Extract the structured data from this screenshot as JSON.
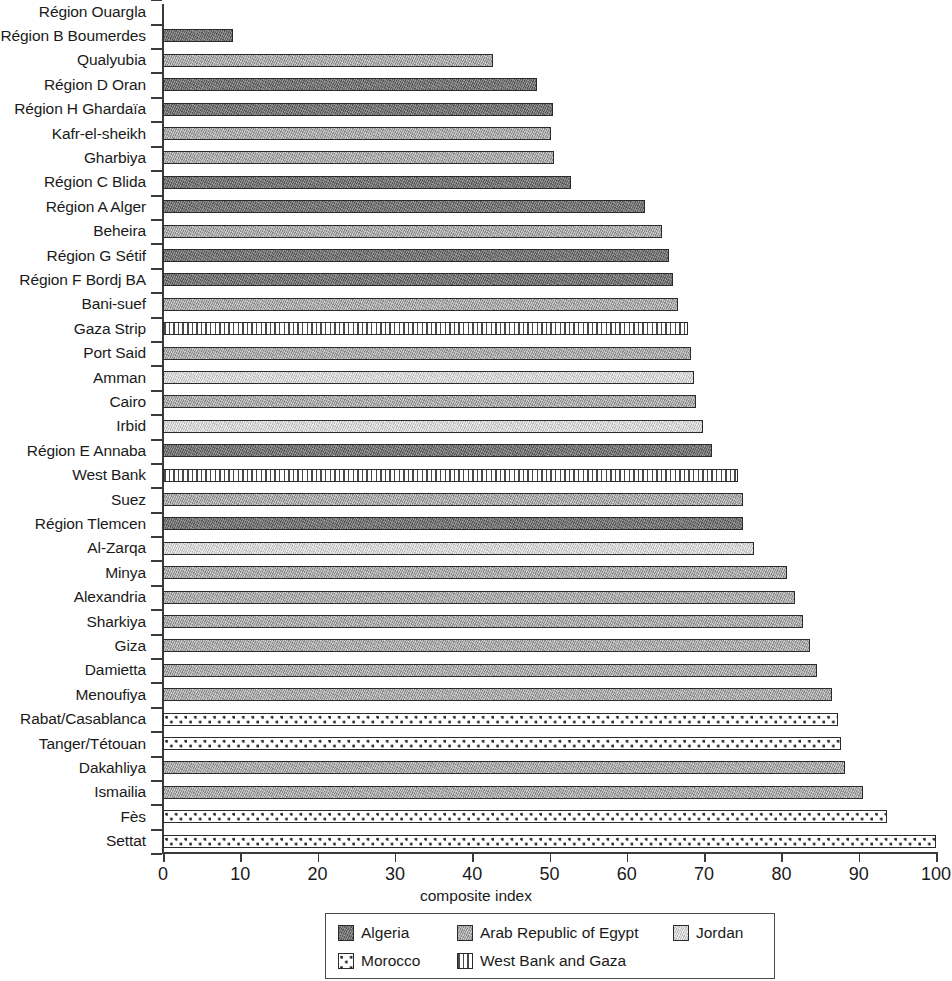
{
  "chart_data": {
    "type": "bar",
    "orientation": "horizontal",
    "title": "",
    "xlabel": "composite index",
    "ylabel": "",
    "xlim": [
      0,
      100
    ],
    "xticks": [
      0,
      10,
      20,
      30,
      40,
      50,
      60,
      70,
      80,
      90,
      100
    ],
    "grid": false,
    "legend_position": "bottom",
    "categories": [
      "Région Ouargla",
      "Région B Boumerdes",
      "Qualyubia",
      "Région D Oran",
      "Région H Ghardaïa",
      "Kafr-el-sheikh",
      "Gharbiya",
      "Région C Blida",
      "Région A Alger",
      "Beheira",
      "Région G Sétif",
      "Région F Bordj BA",
      "Bani-suef",
      "Gaza Strip",
      "Port Said",
      "Amman",
      "Cairo",
      "Irbid",
      "Région E Annaba",
      "West Bank",
      "Suez",
      "Région Tlemcen",
      "Al-Zarqa",
      "Minya",
      "Alexandria",
      "Sharkiya",
      "Giza",
      "Damietta",
      "Menoufiya",
      "Rabat/Casablanca",
      "Tanger/Tétouan",
      "Dakahliya",
      "Ismailia",
      "Fès",
      "Settat"
    ],
    "values": [
      0,
      9.0,
      42.7,
      48.4,
      50.5,
      50.2,
      50.6,
      52.8,
      62.4,
      64.5,
      65.5,
      66.0,
      66.6,
      67.9,
      68.3,
      68.7,
      68.9,
      69.9,
      71.0,
      74.4,
      75.0,
      75.0,
      76.5,
      80.7,
      81.8,
      82.8,
      83.7,
      84.6,
      86.5,
      87.3,
      87.7,
      88.2,
      90.6,
      93.7,
      100.0
    ],
    "groups": [
      "algeria",
      "algeria",
      "egypt",
      "algeria",
      "algeria",
      "egypt",
      "egypt",
      "algeria",
      "algeria",
      "egypt",
      "algeria",
      "algeria",
      "egypt",
      "wbg",
      "egypt",
      "jordan",
      "egypt",
      "jordan",
      "algeria",
      "wbg",
      "egypt",
      "algeria",
      "jordan",
      "egypt",
      "egypt",
      "egypt",
      "egypt",
      "egypt",
      "egypt",
      "morocco",
      "morocco",
      "egypt",
      "egypt",
      "morocco",
      "morocco"
    ],
    "series": [
      {
        "name": "Algeria",
        "key": "algeria",
        "color": "#6e6e6e",
        "pattern": "solid-dark-gray"
      },
      {
        "name": "Arab Republic of Egypt",
        "key": "egypt",
        "color": "#a9a9a9",
        "pattern": "solid-medium-gray"
      },
      {
        "name": "Jordan",
        "key": "jordan",
        "color": "#dcdcdc",
        "pattern": "solid-light-gray"
      },
      {
        "name": "Morocco",
        "key": "morocco",
        "color": "#ffffff",
        "pattern": "dotted"
      },
      {
        "name": "West Bank and Gaza",
        "key": "wbg",
        "color": "#ffffff",
        "pattern": "vertical-stripes"
      }
    ]
  },
  "legend": {
    "items": [
      {
        "label": "Algeria",
        "key": "algeria"
      },
      {
        "label": "Arab Republic of Egypt",
        "key": "egypt"
      },
      {
        "label": "Jordan",
        "key": "jordan"
      },
      {
        "label": "Morocco",
        "key": "morocco"
      },
      {
        "label": "West Bank and Gaza",
        "key": "wbg"
      }
    ]
  }
}
